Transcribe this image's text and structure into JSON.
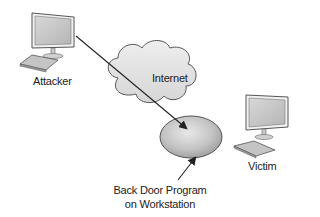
{
  "diagram": {
    "nodes": {
      "attacker": {
        "label": "Attacker",
        "icon": "desktop-computer-icon"
      },
      "internet": {
        "label": "Internet",
        "icon": "cloud-icon"
      },
      "victim": {
        "label": "Victim",
        "icon": "desktop-computer-icon"
      },
      "backdoor": {
        "line1": "Back Door Program",
        "line2": "on Workstation",
        "icon": "ellipse-disk-icon"
      }
    },
    "edges": [
      {
        "from": "attacker",
        "to": "backdoor",
        "style": "line-with-arrow"
      },
      {
        "from": "backdoor-label",
        "to": "backdoor",
        "style": "arrow"
      }
    ],
    "colors": {
      "fill_light": "#e4e4e4",
      "fill_mid": "#b8b8b8",
      "stroke": "#555555",
      "line": "#222222"
    }
  }
}
